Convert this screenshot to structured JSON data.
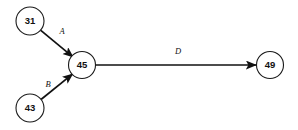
{
  "diagram": {
    "type": "directed-graph",
    "background_color": "#ffffff",
    "stroke_color": "#111111",
    "node_fill_color": "#ffffff",
    "nodes": [
      {
        "id": "n31",
        "label": "31",
        "cx": 30,
        "cy": 21,
        "r": 14
      },
      {
        "id": "n45",
        "label": "45",
        "cx": 82,
        "cy": 65,
        "r": 13.5
      },
      {
        "id": "n43",
        "label": "43",
        "cx": 30,
        "cy": 108,
        "r": 14
      },
      {
        "id": "n49",
        "label": "49",
        "cx": 270,
        "cy": 65,
        "r": 13.5
      }
    ],
    "edges": [
      {
        "id": "eA",
        "label": "A",
        "from": "n31",
        "to": "n45",
        "directed": true,
        "x1": 40.5,
        "y1": 30.2,
        "x2": 73.4,
        "y2": 57.3,
        "label_x": 62,
        "label_y": 32
      },
      {
        "id": "eB",
        "label": "B",
        "from": "n43",
        "to": "n45",
        "directed": true,
        "x1": 41.0,
        "y1": 99.5,
        "x2": 73.0,
        "y2": 73.6,
        "label_x": 48,
        "label_y": 85
      },
      {
        "id": "eD",
        "label": "D",
        "from": "n45",
        "to": "n49",
        "directed": true,
        "x1": 95.5,
        "y1": 65,
        "x2": 256.5,
        "y2": 65,
        "label_x": 178,
        "label_y": 52
      }
    ]
  }
}
